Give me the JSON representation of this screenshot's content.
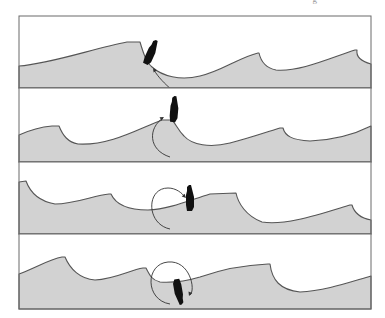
{
  "figure": {
    "corner_text": "g",
    "frame_color": "#6a6a6a",
    "sea_color": "#d2d2d2",
    "boat_color": "#111111",
    "panels": [
      {
        "index": 1,
        "label": "Boat caught on steep face of breaking wave, stern lifted",
        "y_top": 16,
        "y_bottom": 88,
        "sea_path": "M19,66 C50,64 95,48 127,42 L140,42 C143,52 146,62 152,67 C162,76 180,81 200,76 C220,72 240,57 258,53 L259,53 C261,62 266,68 276,70 C300,72 330,58 355,50 L357,50 C356,56 360,61 371,64 L371,88 L19,88 Z",
        "boat": {
          "x": 150,
          "y": 55,
          "rotate": 25
        },
        "arrow": "M172,90 C165,84 158,77 154,70",
        "arrowhead": {
          "x": 153,
          "y": 68,
          "rotate": -125
        }
      },
      {
        "index": 2,
        "label": "Bow digs in, boat rises vertical on crest",
        "y_top": 88,
        "y_bottom": 162,
        "sea_path": "M19,135 C30,130 40,127 52,126 L59,126 C63,136 68,142 78,144 C110,146 140,128 162,120 L172,120 C176,124 178,130 184,136 C192,145 210,148 230,143 C250,138 270,131 280,128 L283,128 C285,136 292,140 310,141 C335,140 355,134 371,126 L371,162 L19,162 Z",
        "boat": {
          "x": 174,
          "y": 112,
          "rotate": 5
        },
        "arrow": "M170,157 C148,150 148,128 163,118",
        "arrowhead": {
          "x": 164,
          "y": 117,
          "rotate": -30
        }
      },
      {
        "index": 3,
        "label": "Boat pitches over the crest, stern flung forward",
        "y_top": 162,
        "y_bottom": 234,
        "sea_path": "M19,182 L26,181 C30,192 38,201 55,204 C75,204 95,195 109,194 L111,194 C115,203 125,210 148,210 C170,209 190,200 210,194 L236,193 C238,203 246,216 262,222 C285,226 320,214 350,205 L352,205 C354,212 360,218 371,220 L371,234 L19,234 Z",
        "boat": {
          "x": 190,
          "y": 201,
          "rotate": 0
        },
        "arrow": "M170,229 C146,224 146,188 168,188 C176,188 182,193 185,197",
        "arrowhead": {
          "x": 186,
          "y": 198,
          "rotate": 45
        }
      },
      {
        "index": 4,
        "label": "Boat completes the pitchpole, upside down in trough",
        "y_top": 234,
        "y_bottom": 309,
        "sea_path": "M19,274 C35,268 50,259 62,257 L65,257 C70,269 80,279 95,280 C115,279 130,270 143,268 L146,268 C150,276 152,280 160,282 C176,283 190,280 200,277 C220,270 245,265 268,264 L270,264 C272,280 280,290 300,292 C325,291 350,282 371,276 L371,309 L19,309 Z",
        "boat": {
          "x": 178,
          "y": 289,
          "rotate": 170
        },
        "arrow": "M170,304 C145,300 145,264 168,262 C190,260 196,290 190,295",
        "arrowhead": {
          "x": 189,
          "y": 296,
          "rotate": 110
        }
      }
    ]
  }
}
